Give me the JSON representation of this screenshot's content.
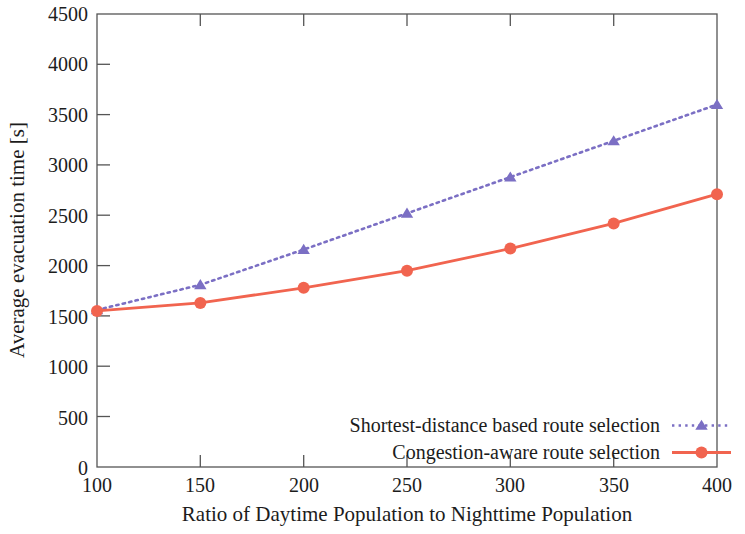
{
  "chart_data": {
    "type": "line",
    "title": "",
    "xlabel": "Ratio of Daytime Population to Nighttime Population",
    "ylabel": "Average evacuation time [s]",
    "x": [
      100,
      150,
      200,
      250,
      300,
      350,
      400
    ],
    "xlim": [
      100,
      400
    ],
    "ylim": [
      0,
      4500
    ],
    "xticks": [
      "100",
      "150",
      "200",
      "250",
      "300",
      "350",
      "400"
    ],
    "yticks": [
      "0",
      "500",
      "1000",
      "1500",
      "2000",
      "2500",
      "3000",
      "3500",
      "4000",
      "4500"
    ],
    "grid": false,
    "legend_position": "bottom-center-inside",
    "series": [
      {
        "name": "Shortest-distance based route selection",
        "values": [
          1560,
          1810,
          2160,
          2520,
          2880,
          3240,
          3600
        ],
        "color": "#7b6fc4",
        "linestyle": "dotted",
        "marker": "triangle"
      },
      {
        "name": "Congestion-aware route selection",
        "values": [
          1550,
          1630,
          1780,
          1950,
          2170,
          2420,
          2710
        ],
        "color": "#f1644f",
        "linestyle": "solid",
        "marker": "circle"
      }
    ]
  }
}
